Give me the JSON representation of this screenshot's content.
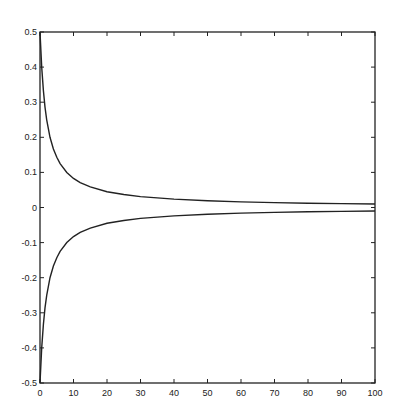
{
  "chart_data": {
    "type": "line",
    "title": "",
    "xlabel": "",
    "ylabel": "",
    "xlim": [
      0,
      100
    ],
    "ylim": [
      -0.5,
      0.5
    ],
    "grid": false,
    "legend": null,
    "xticks": [
      0,
      10,
      20,
      30,
      40,
      50,
      60,
      70,
      80,
      90,
      100
    ],
    "xtick_labels": [
      "0",
      "10",
      "20",
      "30",
      "40",
      "50",
      "60",
      "70",
      "80",
      "90",
      "100"
    ],
    "yticks": [
      0.5,
      0.4,
      0.3,
      0.2,
      0.1,
      0,
      -0.1,
      -0.2,
      -0.3,
      -0.4,
      -0.5
    ],
    "ytick_labels": [
      "0.5",
      "0.4",
      "0.3",
      "0.2",
      "0.1",
      "0",
      "-0.1",
      "-0.2",
      "-0.3",
      "-0.4",
      "-0.5"
    ],
    "x": [
      0,
      0.5,
      1,
      1.5,
      2,
      3,
      4,
      5,
      6,
      8,
      10,
      12,
      15,
      20,
      25,
      30,
      40,
      50,
      60,
      70,
      80,
      90,
      100
    ],
    "series": [
      {
        "name": "upper",
        "values": [
          0.5,
          0.4,
          0.333,
          0.286,
          0.25,
          0.2,
          0.167,
          0.143,
          0.125,
          0.1,
          0.083,
          0.071,
          0.059,
          0.045,
          0.037,
          0.031,
          0.024,
          0.019,
          0.016,
          0.014,
          0.012,
          0.011,
          0.01
        ]
      },
      {
        "name": "lower",
        "values": [
          -0.5,
          -0.4,
          -0.333,
          -0.286,
          -0.25,
          -0.2,
          -0.167,
          -0.143,
          -0.125,
          -0.1,
          -0.083,
          -0.071,
          -0.059,
          -0.045,
          -0.037,
          -0.031,
          -0.024,
          -0.019,
          -0.016,
          -0.014,
          -0.012,
          -0.011,
          -0.01
        ]
      }
    ],
    "line_color": "#222222",
    "axis_color": "#222222"
  }
}
